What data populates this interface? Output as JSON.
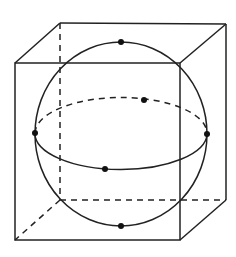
{
  "diagram": {
    "stroke_color": "#222222",
    "background": "#ffffff",
    "cube": {
      "front_face": {
        "x1": 15,
        "y1": 63,
        "x2": 180,
        "y2": 240
      },
      "back_face": {
        "x1": 60,
        "y1": 23,
        "x2": 226,
        "y2": 200
      }
    },
    "sphere": {
      "cx": 121,
      "cy": 134,
      "r": 86
    },
    "equator": {
      "cx": 121,
      "cy": 134,
      "rx": 86,
      "ry": 36
    },
    "points": [
      {
        "name": "top",
        "x": 121,
        "y": 42
      },
      {
        "name": "bottom",
        "x": 121,
        "y": 226
      },
      {
        "name": "left",
        "x": 35,
        "y": 133
      },
      {
        "name": "right",
        "x": 207,
        "y": 134
      },
      {
        "name": "front",
        "x": 105,
        "y": 169
      },
      {
        "name": "back",
        "x": 144,
        "y": 100
      }
    ]
  }
}
